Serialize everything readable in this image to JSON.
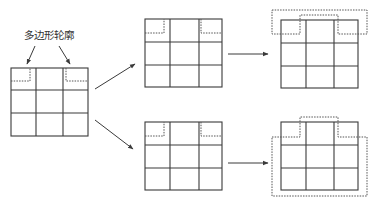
{
  "diagram": {
    "label": "多边形轮廓",
    "colors": {
      "line": "#3a3a3a",
      "dashed_outline": "#555555",
      "background": "#ffffff",
      "text": "#333333"
    },
    "grids": [
      {
        "id": "source",
        "x": 11,
        "y": 68,
        "w": 77,
        "h": 68,
        "rows": 3,
        "cols": 3,
        "outline": "corner-notches"
      },
      {
        "id": "top-middle",
        "x": 145,
        "y": 19,
        "w": 77,
        "h": 68,
        "rows": 3,
        "cols": 3,
        "outline": "corner-notches"
      },
      {
        "id": "bottom-middle",
        "x": 145,
        "y": 122,
        "w": 77,
        "h": 68,
        "rows": 3,
        "cols": 3,
        "outline": "corner-notches"
      },
      {
        "id": "top-right",
        "x": 281,
        "y": 20,
        "w": 77,
        "h": 68,
        "rows": 3,
        "cols": 3,
        "outline": "merged-top-polygon"
      },
      {
        "id": "bottom-right",
        "x": 281,
        "y": 122,
        "w": 77,
        "h": 68,
        "rows": 3,
        "cols": 3,
        "outline": "merged-full-polygon"
      }
    ],
    "arrows": [
      {
        "id": "label-to-left-notch",
        "from": [
          35,
          46
        ],
        "to": [
          27,
          64
        ]
      },
      {
        "id": "label-to-right-notch",
        "from": [
          59,
          46
        ],
        "to": [
          70,
          64
        ]
      },
      {
        "id": "source-to-top",
        "from": [
          95,
          89
        ],
        "to": [
          135,
          64
        ]
      },
      {
        "id": "source-to-bottom",
        "from": [
          95,
          120
        ],
        "to": [
          133,
          149
        ]
      },
      {
        "id": "top-step",
        "from": [
          228,
          54
        ],
        "to": [
          268,
          54
        ]
      },
      {
        "id": "bottom-step",
        "from": [
          228,
          163
        ],
        "to": [
          268,
          163
        ]
      }
    ]
  }
}
